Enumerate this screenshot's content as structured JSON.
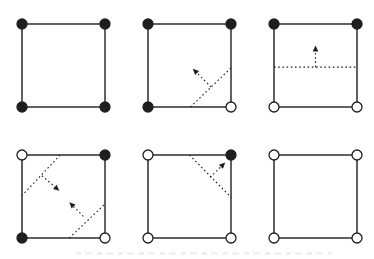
{
  "diagram": {
    "background": "#ffffff",
    "stroke_color": "#1f1f1f",
    "open_dot_fill": "#ffffff",
    "panel_cols_x": [
      22,
      148,
      274
    ],
    "panel_rows_y": [
      24,
      155
    ],
    "square_size": 83,
    "dot_radius": 5,
    "square_stroke_width": 1.4,
    "dotted_stroke_width": 1.1,
    "dotted_dash": "1.6 2.6",
    "panels": [
      {
        "name": "all-corners-filled",
        "row": 0,
        "col": 0,
        "corners": [
          "filled",
          "filled",
          "filled",
          "filled"
        ],
        "cuts": [],
        "arrows": []
      },
      {
        "name": "bottom-right-corner-cut",
        "row": 0,
        "col": 1,
        "corners": [
          "filled",
          "filled",
          "filled",
          "open"
        ],
        "cuts": [
          {
            "x1": 0.51,
            "y1": 1,
            "x2": 1,
            "y2": 0.53
          }
        ],
        "arrows": [
          {
            "x1": 0.76,
            "y1": 0.76,
            "x2": 0.54,
            "y2": 0.54
          }
        ]
      },
      {
        "name": "horizontal-cut",
        "row": 0,
        "col": 2,
        "corners": [
          "filled",
          "filled",
          "open",
          "open"
        ],
        "cuts": [
          {
            "x1": 0,
            "y1": 0.52,
            "x2": 1,
            "y2": 0.52
          }
        ],
        "arrows": [
          {
            "x1": 0.5,
            "y1": 0.52,
            "x2": 0.5,
            "y2": 0.26
          }
        ]
      },
      {
        "name": "two-diagonal-cuts",
        "row": 1,
        "col": 0,
        "corners": [
          "open",
          "filled",
          "filled",
          "open"
        ],
        "cuts": [
          {
            "x1": 0.46,
            "y1": 0,
            "x2": 0,
            "y2": 0.49
          },
          {
            "x1": 0.57,
            "y1": 1,
            "x2": 1,
            "y2": 0.59
          }
        ],
        "arrows": [
          {
            "x1": 0.24,
            "y1": 0.25,
            "x2": 0.45,
            "y2": 0.43
          },
          {
            "x1": 0.74,
            "y1": 0.74,
            "x2": 0.57,
            "y2": 0.57
          }
        ]
      },
      {
        "name": "top-right-corner-cut",
        "row": 1,
        "col": 1,
        "corners": [
          "open",
          "filled",
          "open",
          "open"
        ],
        "cuts": [
          {
            "x1": 0.5,
            "y1": 0,
            "x2": 1,
            "y2": 0.51
          }
        ],
        "arrows": [
          {
            "x1": 0.75,
            "y1": 0.27,
            "x2": 0.93,
            "y2": 0.09
          }
        ]
      },
      {
        "name": "all-corners-open",
        "row": 1,
        "col": 2,
        "corners": [
          "open",
          "open",
          "open",
          "open"
        ],
        "cuts": [],
        "arrows": []
      }
    ]
  }
}
